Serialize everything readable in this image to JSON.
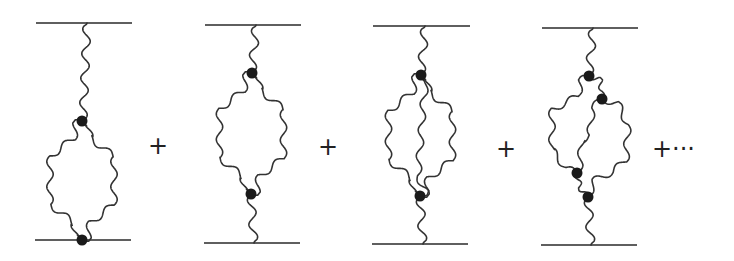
{
  "figure": {
    "line_color": "#2a2a2a",
    "vertex_color": "#1a1a1a",
    "diagrams": [
      {
        "name": "diagram-1",
        "vertices": 2,
        "loop_type": "single-loop-at-lower-line"
      },
      {
        "name": "diagram-2",
        "vertices": 2,
        "loop_type": "single-loop-in-propagator"
      },
      {
        "name": "diagram-3",
        "vertices": 2,
        "loop_type": "three-propagator-loop"
      },
      {
        "name": "diagram-4",
        "vertices": 4,
        "loop_type": "overlapping-loops"
      }
    ],
    "operators": [
      "+",
      "+",
      "+",
      "+···"
    ]
  }
}
